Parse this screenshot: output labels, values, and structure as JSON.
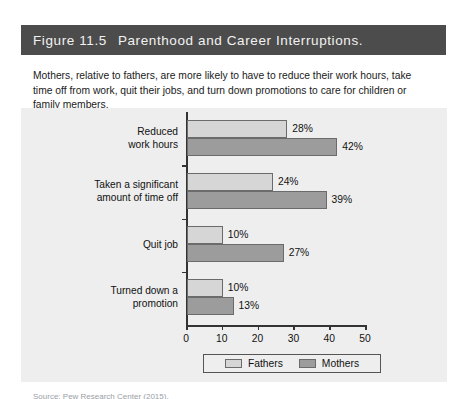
{
  "figure": {
    "number": "Figure 11.5",
    "title": "Parenthood and Career Interruptions.",
    "subtitle": "Mothers, relative to fathers, are more likely to have to reduce their work hours, take time off from work, quit their jobs, and turn down promotions to care for children or family members.",
    "source_caption": "Source: Pew Research Center (2015)."
  },
  "colors": {
    "title_bar": "#4c4c4c",
    "title_text": "#f2f2f2",
    "panel_background": "#eeeeee",
    "fathers_bar": "#d6d6d6",
    "mothers_bar": "#9c9c9c",
    "axis": "#333333"
  },
  "chart_data": {
    "type": "bar",
    "orientation": "horizontal",
    "title": "Parenthood and Career Interruptions.",
    "xlabel": "",
    "ylabel": "",
    "xlim": [
      0,
      50
    ],
    "xticks": [
      0,
      10,
      20,
      30,
      40,
      50
    ],
    "xtick_labels": [
      "0",
      "10",
      "20",
      "30",
      "40",
      "50"
    ],
    "grid": false,
    "legend_position": "bottom",
    "value_suffix": "%",
    "categories": [
      "Reduced\nwork hours",
      "Taken a significant\namount of time off",
      "Quit job",
      "Turned down a\npromotion"
    ],
    "series": [
      {
        "name": "Fathers",
        "color": "#d6d6d6",
        "values": [
          28,
          24,
          10,
          10
        ],
        "labels": [
          "28%",
          "24%",
          "10%",
          "10%"
        ]
      },
      {
        "name": "Mothers",
        "color": "#9c9c9c",
        "values": [
          42,
          39,
          27,
          13
        ],
        "labels": [
          "42%",
          "39%",
          "27%",
          "13%"
        ]
      }
    ]
  }
}
